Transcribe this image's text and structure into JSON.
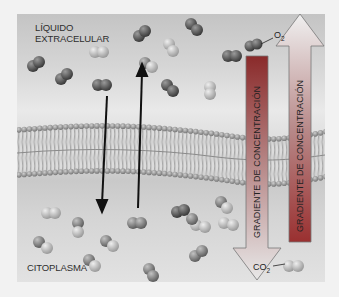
{
  "labels": {
    "extracellular_line1": "LÍQUIDO",
    "extracellular_line2": "EXTRACELULAR",
    "cytoplasm": "CITOPLASMA"
  },
  "gases": {
    "o2": {
      "symbol": "O",
      "subscript": "2"
    },
    "co2": {
      "symbol": "CO",
      "subscript": "2"
    }
  },
  "gradients": [
    {
      "label": "GRADIENTE DE CONCENTRACIÓN",
      "direction": "down",
      "color_top": "#8a2a2a",
      "color_bottom": "#d9d9d9"
    },
    {
      "label": "GRADIENTE DE CONCENTRACIÓN",
      "direction": "up",
      "color_top": "#e8e8e8",
      "color_bottom": "#9a3030"
    }
  ],
  "colors": {
    "o2_molecule": "#6a6a6a",
    "co2_molecule": "#a8a8a8",
    "membrane_head": "#9a9a9a",
    "arrow": "#111111"
  }
}
